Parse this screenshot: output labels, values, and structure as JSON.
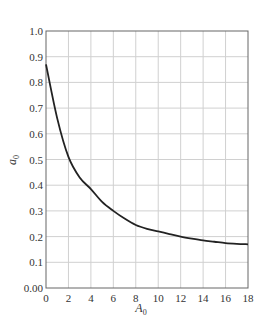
{
  "chart_data": {
    "type": "line",
    "title": "",
    "xlabel": "A0",
    "ylabel": "a0",
    "xlim": [
      0,
      18
    ],
    "ylim": [
      0,
      1.0
    ],
    "grid": true,
    "legend": null,
    "x_ticks": [
      0,
      2,
      4,
      6,
      8,
      10,
      12,
      14,
      16,
      18
    ],
    "x_tick_labels": [
      "0",
      "2",
      "4",
      "6",
      "8",
      "10",
      "12",
      "14",
      "16",
      "18"
    ],
    "y_ticks": [
      0,
      0.1,
      0.2,
      0.3,
      0.4,
      0.5,
      0.6,
      0.7,
      0.8,
      0.9,
      1.0
    ],
    "y_tick_labels": [
      "0.00",
      "0.1",
      "0.2",
      "0.3",
      "0.4",
      "0.5",
      "0.6",
      "0.7",
      "0.8",
      "0.9",
      "1.0"
    ],
    "series": [
      {
        "name": "a0 vs A0",
        "x": [
          0,
          1,
          2,
          3,
          4,
          5,
          6,
          7,
          8,
          9,
          10,
          11,
          12,
          13,
          14,
          15,
          16,
          17,
          18
        ],
        "values": [
          0.87,
          0.66,
          0.51,
          0.43,
          0.385,
          0.335,
          0.3,
          0.27,
          0.245,
          0.23,
          0.22,
          0.21,
          0.2,
          0.192,
          0.185,
          0.18,
          0.175,
          0.172,
          0.17
        ]
      }
    ]
  },
  "labels": {
    "xlabel_main": "A",
    "xlabel_sub": "0",
    "ylabel_main": "a",
    "ylabel_sub": "0"
  },
  "colors": {
    "curve": "#222222",
    "grid": "#d0d0d0",
    "axis": "#555555"
  }
}
